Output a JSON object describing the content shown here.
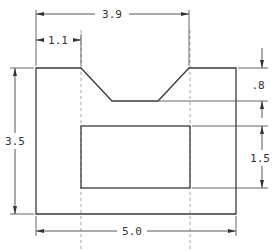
{
  "drawing": {
    "type": "orthographic-view",
    "colors": {
      "object_line": "#3a3a3a",
      "hidden_line": "#9a9a9a",
      "dimension": "#444444",
      "background": "#ffffff"
    },
    "dimensions": {
      "overall_width": "5.0",
      "overall_height": "3.5",
      "notch_span": "3.9",
      "notch_offset": "1.1",
      "notch_depth": ".8",
      "slot_height": "1.5"
    }
  }
}
